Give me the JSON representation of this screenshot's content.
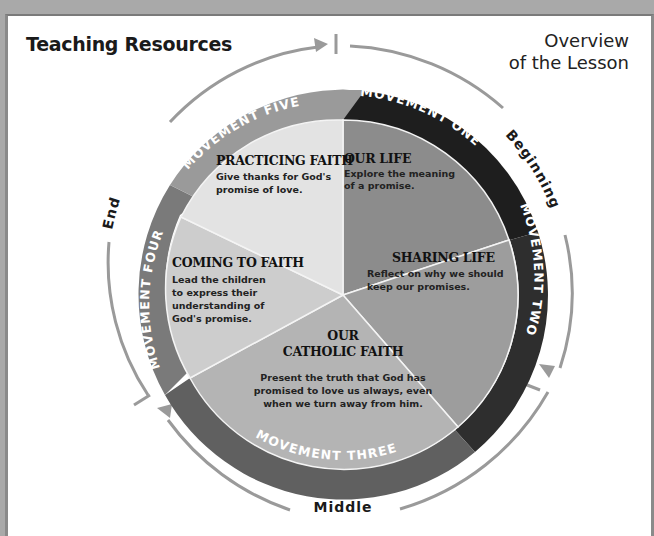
{
  "header": {
    "title": "Teaching Resources",
    "subtitle_line1": "Overview",
    "subtitle_line2": "of the Lesson"
  },
  "stages": {
    "beginning": "Beginning",
    "middle": "Middle",
    "end": "End"
  },
  "movements": [
    {
      "ring_label": "MOVEMENT ONE",
      "heading": "OUR LIFE",
      "body": [
        "Explore the meaning",
        "of a promise."
      ],
      "ring_color": "#1e1e1e",
      "fill_color": "#8c8c8c"
    },
    {
      "ring_label": "MOVEMENT TWO",
      "heading": "SHARING LIFE",
      "body": [
        "Reflect on why we should",
        "keep our promises."
      ],
      "ring_color": "#2e2e2e",
      "fill_color": "#9d9d9d"
    },
    {
      "ring_label": "MOVEMENT THREE",
      "heading_line1": "OUR",
      "heading_line2": "CATHOLIC FAITH",
      "body": [
        "Present the truth that God has",
        "promised to love us always, even",
        "when we turn away from him."
      ],
      "ring_color": "#606060",
      "fill_color": "#b4b4b4"
    },
    {
      "ring_label": "MOVEMENT FOUR",
      "heading": "COMING TO FAITH",
      "body": [
        "Lead the children",
        "to express their",
        "understanding of",
        "God's promise."
      ],
      "ring_color": "#7a7a7a",
      "fill_color": "#cdcdcd"
    },
    {
      "ring_label": "MOVEMENT FIVE",
      "heading": "PRACTICING FAITH",
      "body": [
        "Give thanks for God's",
        "promise of love."
      ],
      "ring_color": "#9a9a9a",
      "fill_color": "#e3e3e3"
    }
  ],
  "colors": {
    "outer_arc": "#9a9a9a",
    "background_frame": "#a9a9a9",
    "page": "#ffffff"
  }
}
